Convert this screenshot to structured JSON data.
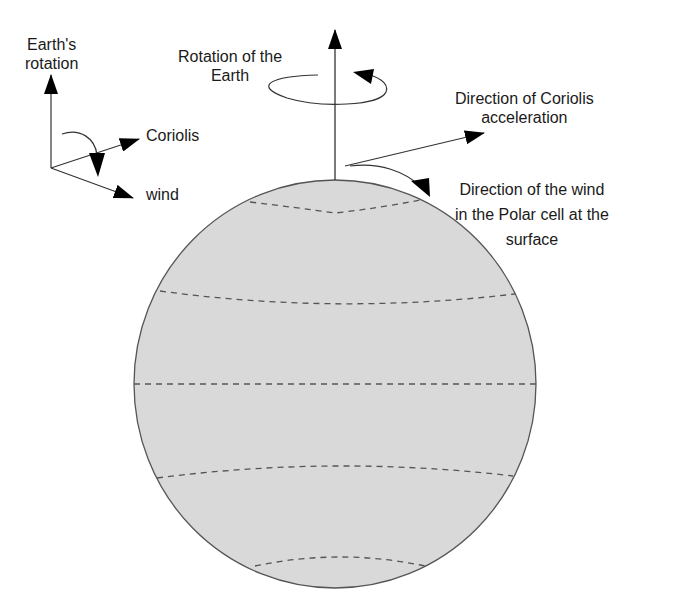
{
  "diagram": {
    "inset": {
      "axis_label_line1": "Earth's",
      "axis_label_line2": "rotation",
      "coriolis_label": "Coriolis",
      "wind_label": "wind"
    },
    "rotation_label": {
      "line1": "Rotation of the",
      "line2": "Earth"
    },
    "coriolis_direction_label": {
      "line1": "Direction of Coriolis",
      "line2": "acceleration"
    },
    "wind_direction_label": {
      "line1": "Direction of the wind",
      "line2": "in the Polar cell at the",
      "line3": "surface"
    },
    "globe": {
      "fill_color": "#d9d9d9",
      "outline_color": "#555555",
      "latitude_lines": 5
    }
  }
}
